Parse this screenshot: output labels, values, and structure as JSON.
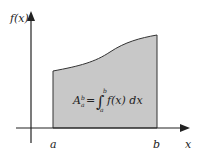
{
  "diagram": {
    "y_axis_label": "f(x)",
    "x_axis_label": "x",
    "lower_limit": "a",
    "upper_limit": "b",
    "formula": {
      "lhs": "A",
      "lhs_sub": "a",
      "lhs_sup": "b",
      "eq": "=",
      "integral": "∫",
      "int_upper": "b",
      "int_lower": "a",
      "integrand": "f(x) dx"
    },
    "colors": {
      "fill": "#c8c8c8",
      "stroke": "#222222",
      "background": "#ffffff"
    }
  }
}
